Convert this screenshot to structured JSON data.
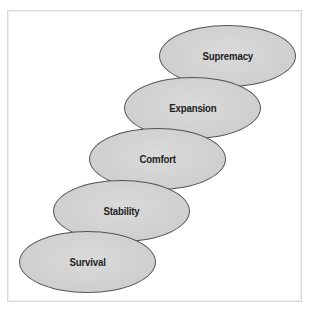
{
  "diagram": {
    "type": "stacked-ellipse-staircase",
    "direction": "bottom-left to top-right",
    "fill_color": "#d2d2d2",
    "outline_color": "#555555",
    "levels": [
      {
        "label": "Survival"
      },
      {
        "label": "Stability"
      },
      {
        "label": "Comfort"
      },
      {
        "label": "Expansion"
      },
      {
        "label": "Supremacy"
      }
    ]
  }
}
